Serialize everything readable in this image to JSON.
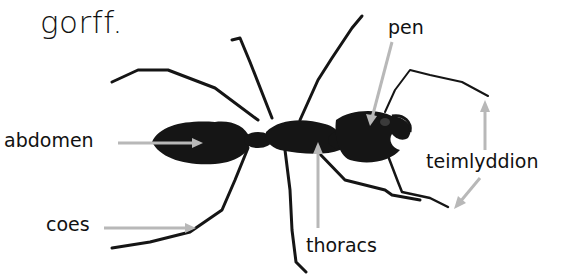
{
  "title": "gorff.",
  "colors": {
    "background": "#ffffff",
    "ink": "#111111",
    "body": "#151515",
    "pointer": "#b8b8b8"
  },
  "labels": {
    "head": "pen",
    "abdomen": "abdomen",
    "legs": "coes",
    "thorax": "thoracs",
    "antennae": "teimlyddion"
  }
}
